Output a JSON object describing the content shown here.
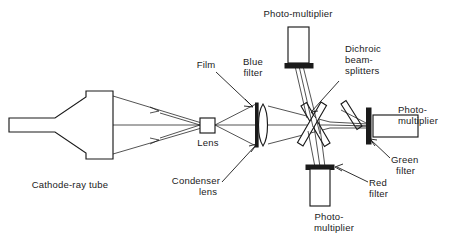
{
  "figure": {
    "background_color": "#ffffff",
    "line_color": "#1a1a1a",
    "width": 452,
    "height": 243
  },
  "labels": {
    "cathode_ray_tube": "Cathode-ray tube",
    "lens": "Lens",
    "condenser_lens_line1": "Condenser",
    "condenser_lens_line2": "lens",
    "film": "Film",
    "blue_filter_line1": "Blue",
    "blue_filter_line2": "filter",
    "photomultiplier_top": "Photo-multiplier",
    "dichroic_line1": "Dichroic",
    "dichroic_line2": "beam-",
    "dichroic_line3": "splitters",
    "photomultiplier_right_line1": "Photo-",
    "photomultiplier_right_line2": "multiplier",
    "green_filter_line1": "Green",
    "green_filter_line2": "filter",
    "red_filter_line1": "Red",
    "red_filter_line2": "filter",
    "photomultiplier_bottom_line1": "Photo-",
    "photomultiplier_bottom_line2": "multiplier"
  },
  "components": [
    {
      "id": "cathode-ray-tube",
      "type": "crt",
      "label": "Cathode-ray tube"
    },
    {
      "id": "lens",
      "type": "square-lens",
      "label": "Lens"
    },
    {
      "id": "condenser-lens",
      "type": "biconvex-lens",
      "label": "Condenser lens"
    },
    {
      "id": "film",
      "type": "film-plane",
      "label": "Film"
    },
    {
      "id": "dichroic-beam-splitter-1",
      "type": "dichroic-plate",
      "label": "Dichroic beam-splitter"
    },
    {
      "id": "dichroic-beam-splitter-2",
      "type": "dichroic-plate",
      "label": "Dichroic beam-splitter"
    },
    {
      "id": "mirror",
      "type": "mirror-plate",
      "label": "Mirror"
    },
    {
      "id": "blue-filter",
      "type": "filter-plate",
      "label": "Blue filter"
    },
    {
      "id": "green-filter",
      "type": "filter-plate",
      "label": "Green filter"
    },
    {
      "id": "red-filter",
      "type": "filter-plate",
      "label": "Red filter"
    },
    {
      "id": "photomultiplier-top",
      "type": "photomultiplier-tube",
      "label": "Photo-multiplier"
    },
    {
      "id": "photomultiplier-right",
      "type": "photomultiplier-tube",
      "label": "Photo-multiplier"
    },
    {
      "id": "photomultiplier-bottom",
      "type": "photomultiplier-tube",
      "label": "Photo-multiplier"
    }
  ]
}
